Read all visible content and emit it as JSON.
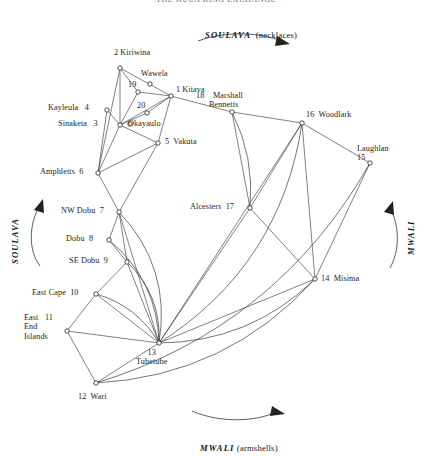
{
  "figure": {
    "title_cut_off": "THE KULA RING EXCHANGE",
    "flows": {
      "top": {
        "name": "SOULAVA",
        "gloss": "(necklaces)"
      },
      "bottom": {
        "name": "MWALI",
        "gloss": "(armshells)"
      },
      "left": {
        "name": "SOULAVA"
      },
      "right": {
        "name": "MWALI"
      }
    }
  },
  "nodes": [
    {
      "id": 1,
      "num": "1",
      "name": "Kitava",
      "label": "1 Kitava",
      "x": 171,
      "y": 96,
      "lx": 176,
      "ly": 85,
      "align": "left"
    },
    {
      "id": 2,
      "num": "2",
      "name": "Kiriwina",
      "label": "2 Kiriwina",
      "x": 120,
      "y": 68,
      "lx": 114,
      "ly": 48,
      "align": "center"
    },
    {
      "id": 3,
      "num": "3",
      "name": "Sinaketa",
      "label": "Sinaketa   3",
      "x": 120,
      "y": 125,
      "lx": 58,
      "ly": 119,
      "align": "left"
    },
    {
      "id": 4,
      "num": "4",
      "name": "Kayleula",
      "label": "Kayleula   4",
      "x": 107,
      "y": 110,
      "lx": 48,
      "ly": 103,
      "align": "left"
    },
    {
      "id": 5,
      "num": "5",
      "name": "Vakuta",
      "label": "5  Vakuta",
      "x": 158,
      "y": 143,
      "lx": 165,
      "ly": 137,
      "align": "left"
    },
    {
      "id": 6,
      "num": "6",
      "name": "Amphletts",
      "label": "Amphletts  6",
      "x": 98,
      "y": 173,
      "lx": 40,
      "ly": 167,
      "align": "left"
    },
    {
      "id": 7,
      "num": "7",
      "name": "NW Dobu",
      "label": "NW Dobu  7",
      "x": 119,
      "y": 212,
      "lx": 61,
      "ly": 206,
      "align": "left"
    },
    {
      "id": 8,
      "num": "8",
      "name": "Dobu",
      "label": "Dobu  8",
      "x": 109,
      "y": 240,
      "lx": 66,
      "ly": 234,
      "align": "left"
    },
    {
      "id": 9,
      "num": "9",
      "name": "SE Dobu",
      "label": "SE Dobu  9",
      "x": 127,
      "y": 262,
      "lx": 69,
      "ly": 256,
      "align": "left"
    },
    {
      "id": 10,
      "num": "10",
      "name": "East Cape",
      "label": "East Cape  10",
      "x": 96,
      "y": 294,
      "lx": 32,
      "ly": 288,
      "align": "left"
    },
    {
      "id": 11,
      "num": "11",
      "name": "East End Islands",
      "label": "East   11\nEnd\nIslands",
      "x": 67,
      "y": 331,
      "lx": 24,
      "ly": 313,
      "align": "left"
    },
    {
      "id": 12,
      "num": "12",
      "name": "Wari",
      "label": "12  Wari",
      "x": 96,
      "y": 383,
      "lx": 78,
      "ly": 392,
      "align": "left"
    },
    {
      "id": 13,
      "num": "13",
      "name": "Tubetube",
      "label": "13\nTubetube",
      "x": 159,
      "y": 343,
      "lx": 136,
      "ly": 348,
      "align": "center"
    },
    {
      "id": 14,
      "num": "14",
      "name": "Misima",
      "label": "14  Misima",
      "x": 315,
      "y": 279,
      "lx": 321,
      "ly": 274,
      "align": "left"
    },
    {
      "id": 15,
      "num": "15",
      "name": "Laughlan",
      "label": "Laughlan\n15",
      "x": 370,
      "y": 163,
      "lx": 357,
      "ly": 144,
      "align": "left"
    },
    {
      "id": 16,
      "num": "16",
      "name": "Woodlark",
      "label": "16  Woodlark",
      "x": 302,
      "y": 123,
      "lx": 306,
      "ly": 110,
      "align": "left"
    },
    {
      "id": 17,
      "num": "17",
      "name": "Alcesters",
      "label": "Alcesters  17",
      "x": 250,
      "y": 208,
      "lx": 190,
      "ly": 202,
      "align": "left"
    },
    {
      "id": 18,
      "num": "18",
      "name": "Marshall Bennetts",
      "label": "18    Marshall\n      Bennetts",
      "x": 232,
      "y": 112,
      "lx": 196,
      "ly": 91,
      "align": "left"
    },
    {
      "id": 19,
      "num": "19",
      "name": "19",
      "label": "19",
      "x": 138,
      "y": 92,
      "lx": 128,
      "ly": 80,
      "align": "left"
    },
    {
      "id": 20,
      "num": "20",
      "name": "20",
      "label": "20",
      "x": 147,
      "y": 113,
      "lx": 137,
      "ly": 101,
      "align": "left"
    },
    {
      "id": 21,
      "num": "",
      "name": "Wawela",
      "label": "Wawela",
      "x": 150,
      "y": 84,
      "lx": 141,
      "ly": 69,
      "align": "left"
    },
    {
      "id": 22,
      "num": "",
      "name": "Okayaulo",
      "label": "Okayaulo",
      "x": 130,
      "y": 124,
      "lx": 128,
      "ly": 119,
      "align": "left"
    }
  ],
  "edges": [
    [
      2,
      3
    ],
    [
      2,
      19
    ],
    [
      2,
      6
    ],
    [
      2,
      1
    ],
    [
      19,
      1
    ],
    [
      19,
      3
    ],
    [
      20,
      1
    ],
    [
      20,
      3
    ],
    [
      1,
      3
    ],
    [
      1,
      5
    ],
    [
      1,
      18
    ],
    [
      3,
      4
    ],
    [
      3,
      5
    ],
    [
      3,
      6
    ],
    [
      4,
      6
    ],
    [
      5,
      6
    ],
    [
      5,
      7
    ],
    [
      6,
      7
    ],
    [
      7,
      8
    ],
    [
      7,
      9
    ],
    [
      7,
      13
    ],
    [
      8,
      9
    ],
    [
      9,
      10
    ],
    [
      9,
      13
    ],
    [
      10,
      11
    ],
    [
      10,
      13
    ],
    [
      11,
      12
    ],
    [
      11,
      13
    ],
    [
      12,
      13
    ],
    [
      13,
      14
    ],
    [
      13,
      17
    ],
    [
      14,
      16
    ],
    [
      14,
      17
    ],
    [
      16,
      17
    ],
    [
      16,
      18
    ],
    [
      16,
      15
    ],
    [
      16,
      13
    ],
    [
      15,
      14
    ],
    [
      17,
      18
    ]
  ],
  "curved_edges": [
    {
      "from": 7,
      "to": 13,
      "bow": 34
    },
    {
      "from": 8,
      "to": 13,
      "bow": 26
    },
    {
      "from": 9,
      "to": 13,
      "bow": 20
    },
    {
      "from": 10,
      "to": 13,
      "bow": 16
    },
    {
      "from": 16,
      "to": 13,
      "bow": 60
    },
    {
      "from": 14,
      "to": 13,
      "bow": 34
    },
    {
      "from": 14,
      "to": 12,
      "bow": 50
    },
    {
      "from": 15,
      "to": 12,
      "bow": 70
    },
    {
      "from": 18,
      "to": 17,
      "bow": 14
    }
  ]
}
